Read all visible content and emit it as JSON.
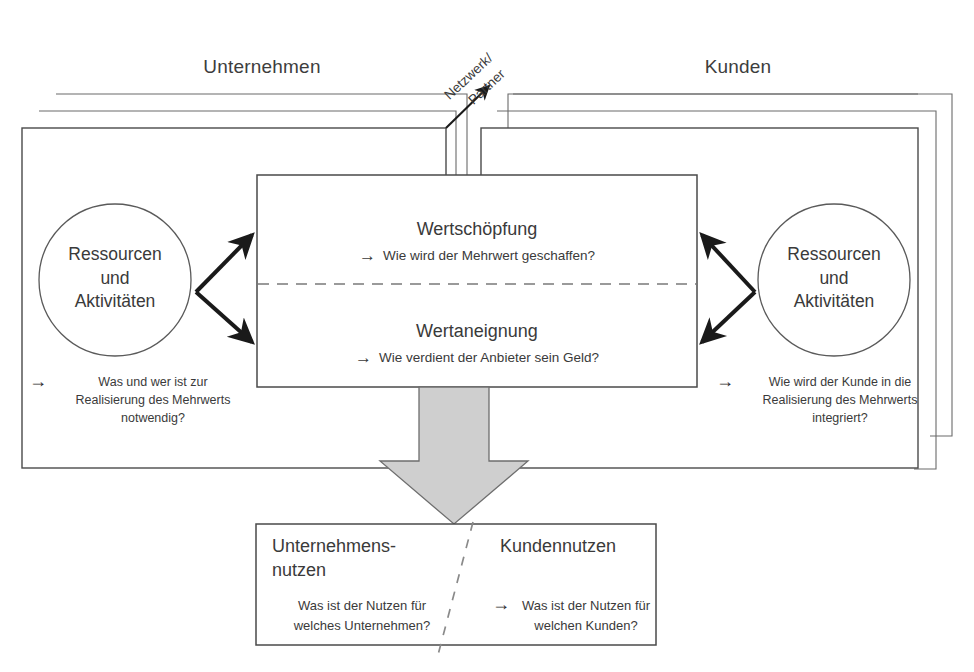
{
  "headings": {
    "left_panel": "Unternehmen",
    "right_panel": "Kunden",
    "network": {
      "line1": "Netzwerk/",
      "line2": "Partner"
    }
  },
  "left_side": {
    "circle": {
      "line1": "Ressourcen",
      "line2": "und",
      "line3": "Aktivitäten"
    },
    "caption": {
      "arrow": "→",
      "line1": "Was und wer ist zur",
      "line2": "Realisierung des Mehrwerts",
      "line3": "notwendig?"
    }
  },
  "right_side": {
    "circle": {
      "line1": "Ressourcen",
      "line2": "und",
      "line3": "Aktivitäten"
    },
    "caption": {
      "arrow": "→",
      "line1": "Wie wird der Kunde in die",
      "line2": "Realisierung des Mehrwerts",
      "line3": "integriert?"
    }
  },
  "center_box": {
    "top": {
      "title": "Wertschöpfung",
      "arrow": "→",
      "question": "Wie wird der Mehrwert geschaffen?"
    },
    "bottom": {
      "title": "Wertaneignung",
      "arrow": "→",
      "question": "Wie verdient der Anbieter sein Geld?"
    }
  },
  "bottom_box": {
    "left": {
      "title_line1": "Unternehmens-",
      "title_line2": "nutzen",
      "question_line1": "Was ist der Nutzen für",
      "question_line2": "welches Unternehmen?"
    },
    "right": {
      "title": "Kundennutzen",
      "arrow": "→",
      "question_line1": "Was ist der Nutzen für",
      "question_line2": "welchen Kunden?"
    }
  },
  "colors": {
    "stroke": "#4a4a4a",
    "thin_stroke": "#6b6b6b",
    "arrow_black": "#1a1a1a",
    "big_arrow_fill": "#cfcfcf",
    "big_arrow_stroke": "#6e6e6e",
    "text": "#3a3a3a",
    "background": "#ffffff"
  }
}
